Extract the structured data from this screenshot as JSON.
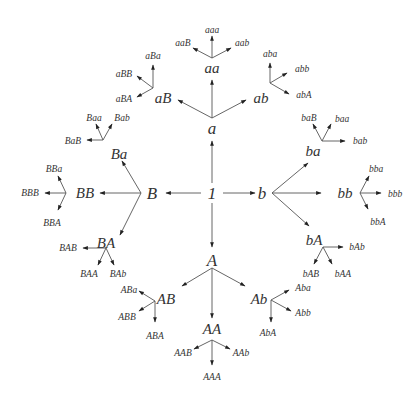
{
  "nodes": {
    "I": "1",
    "a": "a",
    "aa": "aa",
    "aaa": "aaa",
    "aaB": "aaB",
    "aab": "aab",
    "aB": "aB",
    "aBa": "aBa",
    "aBB": "aBB",
    "aBA": "aBA",
    "ab": "ab",
    "aba": "aba",
    "abb": "abb",
    "abA": "abA",
    "B": "B",
    "BB": "BB",
    "BBa": "BBa",
    "BBB": "BBB",
    "BBA": "BBA",
    "Ba": "Ba",
    "Baa": "Baa",
    "Bab": "Bab",
    "BaB": "BaB",
    "BA": "BA",
    "BAB": "BAB",
    "BAA": "BAA",
    "BAb": "BAb",
    "b": "b",
    "bb": "bb",
    "bba": "bba",
    "bbb": "bbb",
    "bbA": "bbA",
    "ba": "ba",
    "baB": "baB",
    "baa": "baa",
    "bab": "bab",
    "bA": "bA",
    "bAb": "bAb",
    "bAB": "bAB",
    "bAA": "bAA",
    "A": "A",
    "AA": "AA",
    "AAB": "AAB",
    "AAb": "AAb",
    "AAA": "AAA",
    "AB": "AB",
    "ABa": "ABa",
    "ABB": "ABB",
    "ABA": "ABA",
    "Ab": "Ab",
    "Aba": "Aba",
    "Abb": "Abb",
    "AbA": "AbA"
  }
}
